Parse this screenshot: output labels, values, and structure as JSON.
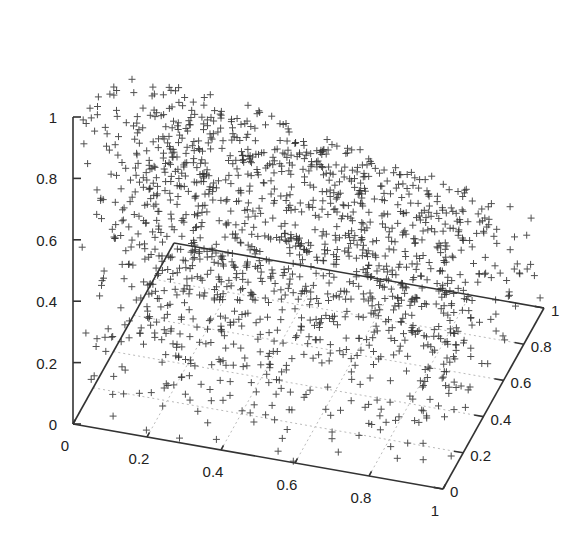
{
  "chart_data": {
    "type": "scatter",
    "subtype": "scatter3d",
    "title": "",
    "xlabel": "",
    "ylabel": "",
    "zlabel": "",
    "marker": "+",
    "marker_color": "#333333",
    "xlim": [
      0,
      1
    ],
    "ylim": [
      0,
      1
    ],
    "zlim": [
      0,
      1
    ],
    "x_ticks": [
      "0",
      "0.2",
      "0.4",
      "0.6",
      "0.8",
      "1"
    ],
    "y_ticks": [
      "0",
      "0.2",
      "0.4",
      "0.6",
      "0.8",
      "1"
    ],
    "z_ticks": [
      "0",
      "0.2",
      "0.4",
      "0.6",
      "0.8",
      "1"
    ],
    "grid": true,
    "legend": "none",
    "distribution": {
      "seed": 12345,
      "count": 1500,
      "z_max_at_y0": 1.0,
      "z_max_at_y1": 0.45
    }
  },
  "projection": {
    "origin": [
      73,
      424
    ],
    "x_unit": [
      370,
      65
    ],
    "y_unit": [
      101,
      -181
    ],
    "z_unit": [
      0,
      -307
    ]
  }
}
